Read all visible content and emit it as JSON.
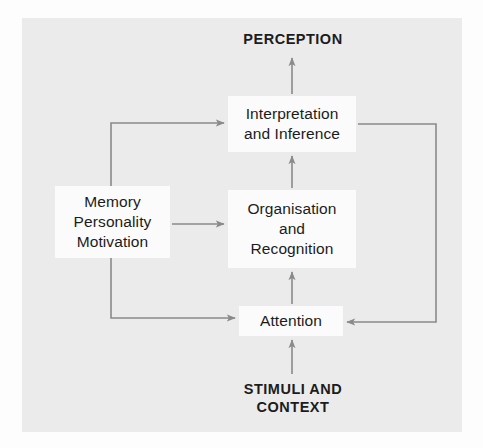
{
  "figure": {
    "type": "flowchart",
    "background_color": "#ebebeb",
    "node_fill_color": "#fbfbfb",
    "connector_color": "#8a8a8a",
    "text_color": "#1c1c1c"
  },
  "labels": {
    "perception": {
      "lines": [
        "PERCEPTION"
      ],
      "style": "uppercase-bold"
    },
    "stimuli": {
      "lines": [
        "STIMULI AND",
        "CONTEXT"
      ],
      "style": "uppercase-bold"
    }
  },
  "nodes": {
    "interpretation": {
      "lines": [
        "Interpretation",
        "and Inference"
      ]
    },
    "organisation": {
      "lines": [
        "Organisation",
        "and",
        "Recognition"
      ]
    },
    "memory": {
      "lines": [
        "Memory",
        "Personality",
        "Motivation"
      ]
    },
    "attention": {
      "lines": [
        "Attention"
      ]
    }
  },
  "connections": [
    {
      "id": "stimuli-to-attention",
      "from": "STIMULI AND CONTEXT",
      "to": "Attention",
      "direction": "up"
    },
    {
      "id": "attention-to-organisation",
      "from": "Attention",
      "to": "Organisation and Recognition",
      "direction": "up"
    },
    {
      "id": "organisation-to-interpretation",
      "from": "Organisation and Recognition",
      "to": "Interpretation and Inference",
      "direction": "up"
    },
    {
      "id": "interpretation-to-perception",
      "from": "Interpretation and Inference",
      "to": "PERCEPTION",
      "direction": "up"
    },
    {
      "id": "memory-to-organisation",
      "from": "Memory Personality Motivation",
      "to": "Organisation and Recognition",
      "direction": "right"
    },
    {
      "id": "memory-to-interpretation",
      "from": "Memory Personality Motivation",
      "to": "Interpretation and Inference",
      "direction": "up-then-right"
    },
    {
      "id": "memory-to-attention",
      "from": "Memory Personality Motivation",
      "to": "Attention",
      "direction": "down-then-right"
    },
    {
      "id": "interpretation-to-attention-feedback",
      "from": "Interpretation and Inference",
      "to": "Attention",
      "direction": "right-then-down-then-left"
    }
  ]
}
